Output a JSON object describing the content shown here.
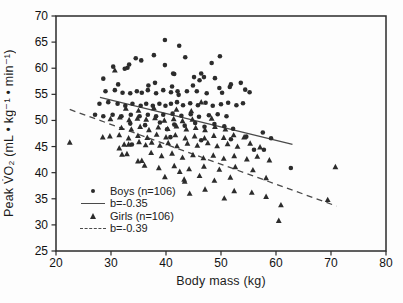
{
  "figure": {
    "x_label": "Body mass (kg)",
    "y_label": "Peak V̇O₂ (mL • kg⁻¹ • min⁻¹)"
  },
  "legend": {
    "boys_label": "Boys (n=106)",
    "boys_slope": "b=-0.35",
    "girls_label": "Girls (n=106)",
    "girls_slope": "b=-0.39"
  },
  "chart_data": {
    "type": "scatter",
    "title": "",
    "xlabel": "Body mass (kg)",
    "ylabel": "Peak V̇O₂ (mL • kg⁻¹ • min⁻¹)",
    "xlim": [
      20,
      80
    ],
    "ylim": [
      25,
      70
    ],
    "x_ticks": [
      20,
      30,
      40,
      50,
      60,
      70,
      80
    ],
    "y_ticks": [
      25,
      30,
      35,
      40,
      45,
      50,
      55,
      60,
      65,
      70
    ],
    "grid": false,
    "legend_position": "lower-left-inside",
    "marker_color": "#2c2c2c",
    "line_color": "#4a4a4a",
    "axis_color": "#2b2b2b",
    "series": [
      {
        "name": "Boys (n=106)",
        "marker": "circle",
        "regression": {
          "label": "b=-0.35",
          "style": "solid",
          "x": [
            28,
            63
          ],
          "y": [
            54.4,
            45.4
          ]
        },
        "points": [
          [
            39.8,
            65.4
          ],
          [
            42.4,
            64.3
          ],
          [
            37.8,
            62.5
          ],
          [
            43.5,
            62.1
          ],
          [
            49.8,
            62.3
          ],
          [
            34.5,
            61.9
          ],
          [
            35.5,
            61.5
          ],
          [
            48.3,
            61.0
          ],
          [
            33.3,
            60.7
          ],
          [
            30.4,
            60.3
          ],
          [
            33.0,
            60.1
          ],
          [
            32.5,
            59.9
          ],
          [
            39.8,
            60.6
          ],
          [
            46.4,
            59.0
          ],
          [
            41.3,
            59.0
          ],
          [
            41.5,
            58.9
          ],
          [
            28.6,
            58.0
          ],
          [
            45.1,
            58.3
          ],
          [
            46.9,
            58.3
          ],
          [
            48.9,
            58.1
          ],
          [
            46.1,
            57.7
          ],
          [
            38.0,
            57.2
          ],
          [
            53.6,
            57.2
          ],
          [
            51.8,
            56.9
          ],
          [
            31.3,
            56.9
          ],
          [
            36.8,
            56.7
          ],
          [
            44.9,
            56.7
          ],
          [
            41.1,
            56.5
          ],
          [
            51.6,
            56.4
          ],
          [
            49.7,
            56.2
          ],
          [
            54.4,
            55.9
          ],
          [
            42.1,
            55.6
          ],
          [
            43.8,
            55.6
          ],
          [
            45.6,
            55.6
          ],
          [
            29.0,
            55.6
          ],
          [
            30.7,
            55.8
          ],
          [
            36.7,
            55.8
          ],
          [
            39.5,
            55.8
          ],
          [
            32.1,
            55.3
          ],
          [
            35.6,
            55.3
          ],
          [
            38.2,
            55.2
          ],
          [
            33.5,
            55.2
          ],
          [
            34.7,
            55.6
          ],
          [
            40.9,
            55.4
          ],
          [
            47.4,
            55.2
          ],
          [
            50.2,
            55.3
          ],
          [
            55.2,
            55.4
          ],
          [
            42.3,
            54.9
          ],
          [
            54.6,
            46.9
          ],
          [
            59.1,
            46.6
          ],
          [
            57.8,
            44.4
          ],
          [
            27.9,
            53.2
          ],
          [
            29.5,
            53.5
          ],
          [
            31.2,
            53.2
          ],
          [
            32.6,
            52.8
          ],
          [
            33.9,
            53.2
          ],
          [
            35.4,
            52.8
          ],
          [
            36.4,
            53.2
          ],
          [
            37.6,
            52.8
          ],
          [
            38.8,
            53.2
          ],
          [
            39.9,
            52.8
          ],
          [
            40.9,
            53.2
          ],
          [
            42.0,
            53.5
          ],
          [
            43.1,
            52.9
          ],
          [
            44.4,
            53.3
          ],
          [
            45.8,
            52.9
          ],
          [
            47.2,
            53.4
          ],
          [
            48.5,
            52.8
          ],
          [
            50.0,
            53.1
          ],
          [
            51.3,
            53.4
          ],
          [
            52.8,
            52.9
          ],
          [
            54.0,
            53.3
          ],
          [
            27.1,
            51.1
          ],
          [
            28.6,
            50.8
          ],
          [
            30.3,
            51.1
          ],
          [
            31.9,
            50.8
          ],
          [
            33.6,
            51.1
          ],
          [
            35.2,
            50.8
          ],
          [
            36.7,
            51.1
          ],
          [
            38.2,
            50.8
          ],
          [
            39.5,
            51.1
          ],
          [
            41.2,
            51.3
          ],
          [
            42.8,
            50.9
          ],
          [
            44.5,
            51.2
          ],
          [
            46.0,
            50.7
          ],
          [
            47.8,
            51.0
          ],
          [
            49.4,
            51.2
          ],
          [
            51.0,
            50.8
          ],
          [
            33.5,
            49.4
          ],
          [
            36.2,
            49.1
          ],
          [
            38.9,
            49.6
          ],
          [
            41.5,
            49.2
          ],
          [
            43.4,
            49.0
          ],
          [
            45.3,
            49.5
          ],
          [
            47.0,
            48.8
          ],
          [
            48.8,
            49.3
          ],
          [
            50.6,
            48.9
          ],
          [
            40.2,
            48.3
          ],
          [
            52.2,
            48.4
          ],
          [
            57.6,
            47.7
          ],
          [
            33.8,
            45.4
          ],
          [
            40.8,
            46.8
          ],
          [
            46.4,
            46.2
          ],
          [
            51.8,
            46.4
          ],
          [
            56.0,
            44.4
          ],
          [
            62.7,
            40.9
          ]
        ]
      },
      {
        "name": "Girls (n=106)",
        "marker": "triangle",
        "regression": {
          "label": "b=-0.39",
          "style": "dashed",
          "x": [
            22.5,
            71
          ],
          "y": [
            52.1,
            33.6
          ]
        },
        "points": [
          [
            30.7,
            59.6
          ],
          [
            46.4,
            53.5
          ],
          [
            32.7,
            52.3
          ],
          [
            35.0,
            51.9
          ],
          [
            37.8,
            52.4
          ],
          [
            41.9,
            52.1
          ],
          [
            44.6,
            51.8
          ],
          [
            58.2,
            39.0
          ],
          [
            69.4,
            34.8
          ],
          [
            29.9,
            50.3
          ],
          [
            31.6,
            50.6
          ],
          [
            33.3,
            50.1
          ],
          [
            34.8,
            50.4
          ],
          [
            36.4,
            50.2
          ],
          [
            38.0,
            50.5
          ],
          [
            39.7,
            50.0
          ],
          [
            41.4,
            50.3
          ],
          [
            43.0,
            49.9
          ],
          [
            44.8,
            50.2
          ],
          [
            47.1,
            36.8
          ],
          [
            48.3,
            50.4
          ],
          [
            31.9,
            48.6
          ],
          [
            33.7,
            48.3
          ],
          [
            35.3,
            48.8
          ],
          [
            36.9,
            48.2
          ],
          [
            38.6,
            48.7
          ],
          [
            40.3,
            48.4
          ],
          [
            41.9,
            48.9
          ],
          [
            43.7,
            48.3
          ],
          [
            45.4,
            48.6
          ],
          [
            47.1,
            48.2
          ],
          [
            48.9,
            48.8
          ],
          [
            50.8,
            48.3
          ],
          [
            55.6,
            36.2
          ],
          [
            60.5,
            30.8
          ],
          [
            28.5,
            46.8
          ],
          [
            29.8,
            47.0
          ],
          [
            31.5,
            47.2
          ],
          [
            33.2,
            46.6
          ],
          [
            34.9,
            47.1
          ],
          [
            36.6,
            46.7
          ],
          [
            38.3,
            47.3
          ],
          [
            40.0,
            46.8
          ],
          [
            41.7,
            47.2
          ],
          [
            43.5,
            46.6
          ],
          [
            45.2,
            47.0
          ],
          [
            47.0,
            46.6
          ],
          [
            48.7,
            47.1
          ],
          [
            50.5,
            46.7
          ],
          [
            52.3,
            47.2
          ],
          [
            54.2,
            46.8
          ],
          [
            22.5,
            45.8
          ],
          [
            31.5,
            44.7
          ],
          [
            32.4,
            45.4
          ],
          [
            33.2,
            45.4
          ],
          [
            35.1,
            45.9
          ],
          [
            36.3,
            45.3
          ],
          [
            37.4,
            45.8
          ],
          [
            38.9,
            45.2
          ],
          [
            40.4,
            45.7
          ],
          [
            42.0,
            45.1
          ],
          [
            43.9,
            45.6
          ],
          [
            45.7,
            45.2
          ],
          [
            47.6,
            45.7
          ],
          [
            49.3,
            45.1
          ],
          [
            51.2,
            45.5
          ],
          [
            53.0,
            45.0
          ],
          [
            55.3,
            45.6
          ],
          [
            57.1,
            44.9
          ],
          [
            32.0,
            43.5
          ],
          [
            32.9,
            43.6
          ],
          [
            34.9,
            42.2
          ],
          [
            35.6,
            42.3
          ],
          [
            37.3,
            43.8
          ],
          [
            39.2,
            43.2
          ],
          [
            41.1,
            43.7
          ],
          [
            43.0,
            42.9
          ],
          [
            44.9,
            43.4
          ],
          [
            46.8,
            42.8
          ],
          [
            48.6,
            43.3
          ],
          [
            50.5,
            42.7
          ],
          [
            52.4,
            43.2
          ],
          [
            54.7,
            42.6
          ],
          [
            56.6,
            43.1
          ],
          [
            58.8,
            42.4
          ],
          [
            36.1,
            41.4
          ],
          [
            38.7,
            40.9
          ],
          [
            41.5,
            41.3
          ],
          [
            44.2,
            40.7
          ],
          [
            46.9,
            41.2
          ],
          [
            49.7,
            40.6
          ],
          [
            52.6,
            41.1
          ],
          [
            55.8,
            40.5
          ],
          [
            70.8,
            41.1
          ],
          [
            42.5,
            40.2
          ],
          [
            39.8,
            39.2
          ],
          [
            43.3,
            38.7
          ],
          [
            46.1,
            39.4
          ],
          [
            48.8,
            38.5
          ],
          [
            51.7,
            39.1
          ],
          [
            43.4,
            38.3
          ],
          [
            44.3,
            36.0
          ],
          [
            50.6,
            35.1
          ],
          [
            52.4,
            36.5
          ],
          [
            58.2,
            35.4
          ],
          [
            60.9,
            33.8
          ]
        ]
      }
    ]
  }
}
